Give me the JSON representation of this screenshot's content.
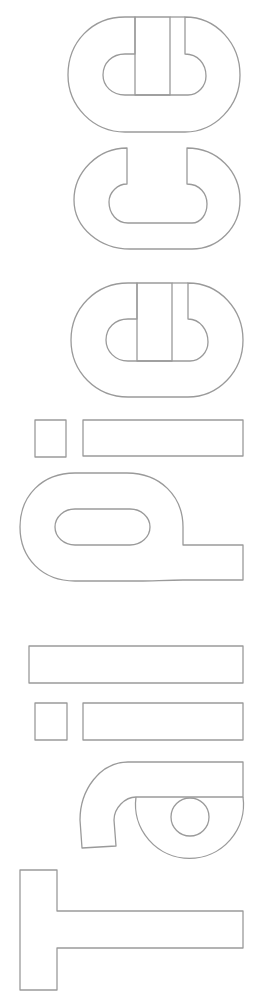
{
  "artwork": {
    "word": "Tailpiece",
    "orientation": "rotated -90deg (reads bottom to top)",
    "style": "outlined letters, no fill",
    "stroke_color": "#9a9a9a",
    "background_color": "#ffffff",
    "letters": [
      "T",
      "a",
      "i",
      "l",
      "p",
      "i",
      "e",
      "c",
      "e"
    ]
  }
}
